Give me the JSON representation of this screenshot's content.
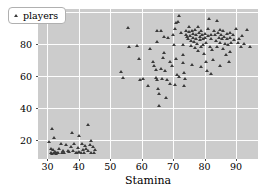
{
  "chart_data": {
    "type": "scatter",
    "title": "",
    "xlabel": "Stamina",
    "ylabel": "Dribbling",
    "xlim": [
      27,
      97
    ],
    "ylim": [
      8,
      102
    ],
    "xticks": [
      30,
      40,
      50,
      60,
      70,
      80,
      90
    ],
    "yticks": [
      20,
      40,
      60,
      80,
      100
    ],
    "grid": true,
    "background_color": "#cccccc",
    "gridline_color": "#fdfdfd",
    "marker_color": "#3a3a3a",
    "marker_shape": "triangle",
    "legend": {
      "position": "upper-left",
      "entries": [
        {
          "label": "players",
          "marker": "triangle",
          "color": "#3a3a3a"
        }
      ]
    },
    "series": [
      {
        "name": "players",
        "points": [
          [
            30.5,
            18.5
          ],
          [
            31.0,
            14.5
          ],
          [
            31.2,
            12.0
          ],
          [
            31.4,
            11.0
          ],
          [
            31.6,
            26.5
          ],
          [
            31.8,
            13.5
          ],
          [
            32.0,
            11.5
          ],
          [
            32.2,
            21.0
          ],
          [
            32.4,
            12.5
          ],
          [
            32.6,
            11.0
          ],
          [
            33.0,
            12.0
          ],
          [
            33.4,
            11.5
          ],
          [
            33.8,
            14.0
          ],
          [
            34.2,
            17.5
          ],
          [
            34.6,
            11.5
          ],
          [
            35.0,
            13.0
          ],
          [
            35.4,
            12.0
          ],
          [
            36.0,
            17.0
          ],
          [
            36.6,
            13.0
          ],
          [
            37.0,
            12.5
          ],
          [
            37.4,
            15.5
          ],
          [
            37.8,
            24.5
          ],
          [
            38.2,
            13.0
          ],
          [
            38.6,
            17.5
          ],
          [
            39.0,
            12.0
          ],
          [
            39.4,
            11.5
          ],
          [
            39.8,
            15.0
          ],
          [
            40.0,
            22.5
          ],
          [
            40.2,
            12.5
          ],
          [
            40.6,
            11.5
          ],
          [
            41.0,
            17.5
          ],
          [
            41.2,
            13.5
          ],
          [
            41.6,
            12.0
          ],
          [
            42.0,
            16.0
          ],
          [
            42.4,
            14.5
          ],
          [
            42.8,
            29.5
          ],
          [
            43.0,
            13.0
          ],
          [
            43.4,
            17.0
          ],
          [
            43.8,
            12.0
          ],
          [
            44.0,
            19.5
          ],
          [
            44.4,
            15.5
          ],
          [
            44.8,
            11.5
          ],
          [
            45.0,
            13.5
          ],
          [
            53.5,
            62.5
          ],
          [
            54.0,
            58.5
          ],
          [
            55.5,
            90.0
          ],
          [
            56.0,
            78.5
          ],
          [
            58.5,
            79.0
          ],
          [
            59.5,
            57.5
          ],
          [
            60.5,
            58.0
          ],
          [
            62.0,
            54.0
          ],
          [
            64.0,
            66.0
          ],
          [
            64.5,
            63.5
          ],
          [
            64.5,
            59.0
          ],
          [
            64.8,
            57.5
          ],
          [
            65.0,
            88.5
          ],
          [
            65.0,
            81.5
          ],
          [
            65.2,
            52.0
          ],
          [
            65.4,
            48.5
          ],
          [
            65.6,
            41.5
          ],
          [
            66.0,
            88.5
          ],
          [
            66.2,
            64.5
          ],
          [
            66.5,
            58.0
          ],
          [
            67.0,
            84.5
          ],
          [
            67.2,
            74.5
          ],
          [
            67.5,
            63.0
          ],
          [
            67.8,
            46.5
          ],
          [
            68.0,
            57.5
          ],
          [
            68.5,
            84.0
          ],
          [
            69.0,
            68.5
          ],
          [
            69.5,
            66.0
          ],
          [
            70.0,
            86.0
          ],
          [
            70.2,
            79.5
          ],
          [
            70.5,
            89.5
          ],
          [
            70.8,
            93.0
          ],
          [
            71.0,
            70.5
          ],
          [
            71.2,
            60.5
          ],
          [
            71.5,
            94.0
          ],
          [
            71.8,
            97.5
          ],
          [
            72.0,
            59.5
          ],
          [
            72.5,
            87.0
          ],
          [
            73.0,
            79.5
          ],
          [
            73.2,
            68.0
          ],
          [
            73.5,
            62.0
          ],
          [
            73.8,
            58.0
          ],
          [
            74.0,
            88.0
          ],
          [
            74.2,
            86.0
          ],
          [
            74.5,
            84.5
          ],
          [
            74.8,
            83.0
          ],
          [
            75.0,
            90.5
          ],
          [
            75.2,
            87.5
          ],
          [
            75.4,
            85.0
          ],
          [
            75.6,
            82.0
          ],
          [
            75.8,
            79.0
          ],
          [
            76.0,
            88.5
          ],
          [
            76.2,
            86.5
          ],
          [
            76.4,
            84.0
          ],
          [
            76.6,
            81.5
          ],
          [
            76.8,
            77.5
          ],
          [
            77.0,
            89.0
          ],
          [
            77.2,
            86.0
          ],
          [
            77.4,
            83.5
          ],
          [
            77.6,
            80.0
          ],
          [
            77.8,
            75.5
          ],
          [
            78.0,
            91.0
          ],
          [
            78.2,
            87.0
          ],
          [
            78.4,
            84.5
          ],
          [
            78.6,
            82.5
          ],
          [
            78.8,
            78.5
          ],
          [
            79.0,
            88.0
          ],
          [
            79.2,
            85.5
          ],
          [
            79.4,
            83.0
          ],
          [
            79.6,
            79.5
          ],
          [
            79.8,
            74.0
          ],
          [
            80.0,
            86.5
          ],
          [
            80.2,
            84.0
          ],
          [
            80.4,
            81.0
          ],
          [
            80.5,
            68.5
          ],
          [
            80.8,
            63.0
          ],
          [
            81.0,
            89.5
          ],
          [
            81.2,
            85.0
          ],
          [
            81.5,
            95.5
          ],
          [
            81.8,
            78.0
          ],
          [
            82.0,
            86.0
          ],
          [
            82.2,
            83.5
          ],
          [
            82.5,
            76.5
          ],
          [
            82.8,
            70.0
          ],
          [
            83.0,
            88.5
          ],
          [
            83.2,
            85.5
          ],
          [
            83.5,
            82.0
          ],
          [
            83.8,
            78.5
          ],
          [
            84.0,
            94.5
          ],
          [
            84.2,
            87.0
          ],
          [
            84.5,
            84.0
          ],
          [
            84.8,
            80.5
          ],
          [
            85.0,
            89.0
          ],
          [
            85.2,
            86.0
          ],
          [
            85.5,
            83.0
          ],
          [
            85.8,
            77.0
          ],
          [
            86.0,
            88.0
          ],
          [
            86.2,
            84.5
          ],
          [
            86.5,
            80.0
          ],
          [
            86.8,
            73.0
          ],
          [
            87.0,
            86.5
          ],
          [
            87.2,
            83.5
          ],
          [
            87.5,
            79.5
          ],
          [
            87.8,
            68.5
          ],
          [
            88.0,
            87.0
          ],
          [
            88.2,
            84.0
          ],
          [
            88.5,
            81.0
          ],
          [
            89.0,
            85.5
          ],
          [
            89.5,
            82.5
          ],
          [
            90.0,
            89.5
          ],
          [
            90.5,
            80.5
          ],
          [
            91.0,
            83.0
          ],
          [
            91.5,
            78.5
          ],
          [
            92.0,
            85.0
          ],
          [
            92.5,
            80.0
          ],
          [
            93.5,
            89.0
          ],
          [
            94.5,
            78.5
          ],
          [
            62.5,
            77.0
          ],
          [
            69.0,
            55.0
          ],
          [
            70.5,
            54.5
          ],
          [
            73.5,
            53.5
          ],
          [
            76.0,
            67.0
          ],
          [
            79.0,
            65.5
          ],
          [
            82.0,
            61.5
          ],
          [
            85.0,
            66.5
          ],
          [
            88.0,
            75.0
          ],
          [
            73.0,
            73.0
          ],
          [
            66.8,
            71.5
          ],
          [
            63.5,
            69.0
          ],
          [
            59.0,
            70.5
          ]
        ]
      }
    ]
  }
}
